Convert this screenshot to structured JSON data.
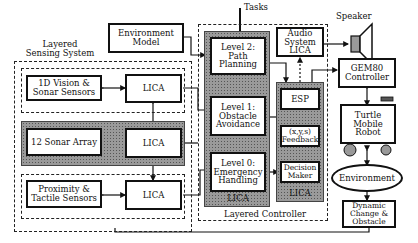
{
  "diagram": {
    "top_input": "Tasks",
    "speaker_label": "Speaker",
    "environment_model": "Environment Model",
    "sensing_system": {
      "title": "Layered Sensing System",
      "rows": [
        {
          "sensor": "1D Vision & Sonar Sensors",
          "lica": "LICA",
          "shaded": false
        },
        {
          "sensor": "12 Sonar Array",
          "lica": "LICA",
          "shaded": true
        },
        {
          "sensor": "Proximity & Tactile Sensors",
          "lica": "LICA",
          "shaded": false
        }
      ]
    },
    "controller": {
      "title": "Layered Controller",
      "levels": [
        {
          "label": "Level 2: Path Planning"
        },
        {
          "label": "Level 1: Obstacle Avoidance"
        },
        {
          "label": "Level 0: Emergency Handling"
        }
      ],
      "levels_lica": "LICA",
      "esp_column": {
        "esp": "ESP",
        "feedback": "(x,y,s) Feedback",
        "decision": "Decision Maker",
        "lica": "LICA"
      },
      "audio": "Audio System LICA"
    },
    "right_side": {
      "gem80": "GEM80 Controller",
      "robot": "Turtle Mobile Robot",
      "environment": "Environment",
      "dynamic": "Dynamic Change & Obstacle"
    }
  }
}
